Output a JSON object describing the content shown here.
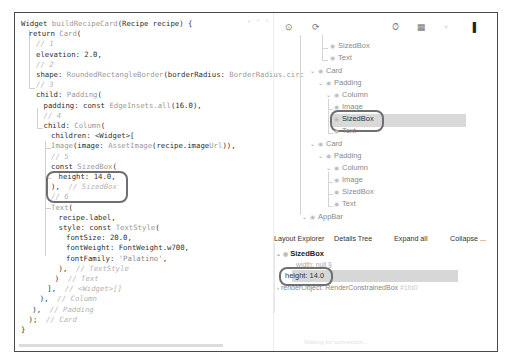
{
  "editor": {
    "lines": [
      {
        "indent": 0,
        "parts": [
          [
            "kw",
            "Widget "
          ],
          [
            "cls",
            "buildRecipeCard"
          ],
          [
            "kw",
            "(Recipe recipe) {"
          ]
        ]
      },
      {
        "indent": 1,
        "parts": [
          [
            "kw",
            "return "
          ],
          [
            "cls",
            "Card"
          ],
          [
            "kw",
            "("
          ]
        ]
      },
      {
        "indent": 2,
        "parts": [
          [
            "cm",
            "// 1"
          ]
        ]
      },
      {
        "indent": 2,
        "parts": [
          [
            "kw",
            "elevation: 2.0,"
          ]
        ]
      },
      {
        "indent": 2,
        "parts": [
          [
            "cm",
            "// 2"
          ]
        ]
      },
      {
        "indent": 2,
        "parts": [
          [
            "kw",
            "shape: "
          ],
          [
            "cls",
            "RoundedRectangleBorder"
          ],
          [
            "kw",
            "(borderRadius: "
          ],
          [
            "cls",
            "BorderRadius.circ"
          ]
        ]
      },
      {
        "indent": 2,
        "parts": [
          [
            "cm",
            "// 3"
          ]
        ]
      },
      {
        "indent": 2,
        "parts": [
          [
            "kw",
            "child: "
          ],
          [
            "cls",
            "Padding"
          ],
          [
            "kw",
            "("
          ]
        ]
      },
      {
        "indent": 3,
        "parts": [
          [
            "kw",
            "padding: const "
          ],
          [
            "cls",
            "EdgeInsets.all"
          ],
          [
            "kw",
            "(16.0),"
          ]
        ]
      },
      {
        "indent": 3,
        "parts": [
          [
            "cm",
            "// 4"
          ]
        ]
      },
      {
        "indent": 3,
        "parts": [
          [
            "kw",
            "child: "
          ],
          [
            "cls",
            "Column"
          ],
          [
            "kw",
            "("
          ]
        ]
      },
      {
        "indent": 4,
        "parts": [
          [
            "kw",
            "children: <Widget>["
          ]
        ]
      },
      {
        "indent": 4,
        "parts": [
          [
            "cls",
            "Image"
          ],
          [
            "kw",
            "(image: "
          ],
          [
            "cls",
            "AssetImage"
          ],
          [
            "kw",
            "(recipe.image"
          ],
          [
            "cls",
            "Url"
          ],
          [
            "kw",
            ")),"
          ]
        ]
      },
      {
        "indent": 4,
        "parts": [
          [
            "cm",
            "// 5"
          ]
        ]
      },
      {
        "indent": 4,
        "parts": [
          [
            "kw",
            "const "
          ],
          [
            "cls",
            "SizedBox"
          ],
          [
            "kw",
            "("
          ]
        ]
      },
      {
        "indent": 5,
        "parts": [
          [
            "kw",
            "height: 14.0,"
          ]
        ]
      },
      {
        "indent": 4,
        "parts": [
          [
            "kw",
            "),  "
          ],
          [
            "cm",
            "// SizedBox"
          ]
        ]
      },
      {
        "indent": 4,
        "parts": [
          [
            "cm",
            "// 6"
          ]
        ]
      },
      {
        "indent": 4,
        "parts": [
          [
            "cls",
            "Text"
          ],
          [
            "kw",
            "("
          ]
        ]
      },
      {
        "indent": 5,
        "parts": [
          [
            "kw",
            "recipe.label,"
          ]
        ]
      },
      {
        "indent": 5,
        "parts": [
          [
            "kw",
            "style: const "
          ],
          [
            "cls",
            "TextStyle"
          ],
          [
            "kw",
            "("
          ]
        ]
      },
      {
        "indent": 6,
        "parts": [
          [
            "kw",
            "fontSize: 20.0,"
          ]
        ]
      },
      {
        "indent": 6,
        "parts": [
          [
            "kw",
            "fontWeight: FontWeight.w700,"
          ]
        ]
      },
      {
        "indent": 6,
        "parts": [
          [
            "kw",
            "fontFamily: "
          ],
          [
            "str",
            "'Palatino'"
          ],
          [
            "kw",
            ","
          ]
        ]
      },
      {
        "indent": 5,
        "parts": [
          [
            "kw",
            "),  "
          ],
          [
            "cm",
            "// TextStyle"
          ]
        ]
      },
      {
        "indent": 4.5,
        "parts": [
          [
            "kw",
            ")  "
          ],
          [
            "cm",
            "// Text"
          ]
        ]
      },
      {
        "indent": 3.5,
        "parts": [
          [
            "kw",
            "],  "
          ],
          [
            "cm",
            "// <Widget>[]"
          ]
        ]
      },
      {
        "indent": 2.5,
        "parts": [
          [
            "kw",
            "),  "
          ],
          [
            "cm",
            "// Column"
          ]
        ]
      },
      {
        "indent": 1.5,
        "parts": [
          [
            "kw",
            "),  "
          ],
          [
            "cm",
            "// Padding"
          ]
        ]
      },
      {
        "indent": 1,
        "parts": [
          [
            "kw",
            ");  "
          ],
          [
            "cm",
            "// Card"
          ]
        ]
      },
      {
        "indent": 0,
        "parts": [
          [
            "kw",
            "}"
          ]
        ]
      }
    ],
    "top_hints": "↗ ˄ ˅"
  },
  "toolbar": {
    "icons": [
      {
        "name": "select-widget-mode-icon",
        "glyph": "⊙",
        "x": 9
      },
      {
        "name": "refresh-tree-icon",
        "glyph": "⟳",
        "x": 36
      },
      {
        "name": "performance-overlay-icon",
        "glyph": "⏱",
        "x": 115
      },
      {
        "name": "debug-paint-icon",
        "glyph": "▦",
        "x": 141
      },
      {
        "name": "baseline-icon",
        "glyph": "▫",
        "x": 166
      },
      {
        "name": "repaint-rainbow-icon",
        "glyph": "▌",
        "x": 196
      },
      {
        "name": "slow-animations-icon",
        "glyph": "■",
        "x": 222
      }
    ]
  },
  "widget_tree": {
    "nodes": [
      {
        "label": "SizedBox",
        "x": 56,
        "y": 30,
        "arrow": false
      },
      {
        "label": "Text",
        "x": 56,
        "y": 42,
        "arrow": false
      },
      {
        "label": "Card",
        "x": 36,
        "y": 55,
        "arrow": true
      },
      {
        "label": "Padding",
        "x": 44,
        "y": 67,
        "arrow": true
      },
      {
        "label": "Column",
        "x": 52,
        "y": 79,
        "arrow": true
      },
      {
        "label": "Image",
        "x": 60,
        "y": 91,
        "arrow": false
      },
      {
        "label": "SizedBox",
        "x": 60,
        "y": 103,
        "arrow": false,
        "selected": true
      },
      {
        "label": "Text",
        "x": 60,
        "y": 115,
        "arrow": false
      },
      {
        "label": "Card",
        "x": 36,
        "y": 128,
        "arrow": true
      },
      {
        "label": "Padding",
        "x": 44,
        "y": 140,
        "arrow": true
      },
      {
        "label": "Column",
        "x": 52,
        "y": 152,
        "arrow": true
      },
      {
        "label": "Image",
        "x": 60,
        "y": 164,
        "arrow": false
      },
      {
        "label": "SizedBox",
        "x": 60,
        "y": 176,
        "arrow": false
      },
      {
        "label": "Text",
        "x": 60,
        "y": 188,
        "arrow": false
      },
      {
        "label": "AppBar",
        "x": 28,
        "y": 201,
        "arrow": true
      }
    ]
  },
  "details_tabs": {
    "layout_explorer": "Layout Explorer",
    "details_tree": "Details Tree",
    "expand_all": "Expand all",
    "collapse": "Collapse ..."
  },
  "details": {
    "root": "SizedBox",
    "width_row": "width: null §",
    "height_row": "height: 14.0",
    "render_object_row": "renderObject: RenderConstrainedBox",
    "render_object_suffix": "#1fd0"
  },
  "status_bar": {
    "text": "Waiting for connection..."
  }
}
